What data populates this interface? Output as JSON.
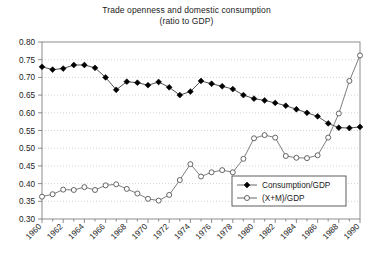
{
  "chart_data": {
    "type": "line",
    "title": "Trade openness and domestic consumption",
    "subtitle": "(ratio to GDP)",
    "xlabel": "",
    "ylabel": "",
    "ylim": [
      0.3,
      0.8
    ],
    "ytick_step": 0.05,
    "ytick_labels": [
      "0.80",
      "0.75",
      "0.70",
      "0.65",
      "0.60",
      "0.55",
      "0.50",
      "0.45",
      "0.40",
      "0.35",
      "0.30"
    ],
    "ytick_values": [
      0.8,
      0.75,
      0.7,
      0.65,
      0.6,
      0.55,
      0.5,
      0.45,
      0.4,
      0.35,
      0.3
    ],
    "xlim": [
      1960,
      1990
    ],
    "x": [
      1960,
      1961,
      1962,
      1963,
      1964,
      1965,
      1966,
      1967,
      1968,
      1969,
      1970,
      1971,
      1972,
      1973,
      1974,
      1975,
      1976,
      1977,
      1978,
      1979,
      1980,
      1981,
      1982,
      1983,
      1984,
      1985,
      1986,
      1987,
      1988,
      1989,
      1990
    ],
    "xtick_labels": [
      "1960",
      "1962",
      "1964",
      "1966",
      "1968",
      "1970",
      "1972",
      "1974",
      "1976",
      "1978",
      "1980",
      "1982",
      "1984",
      "1986",
      "1988",
      "1990"
    ],
    "xtick_values": [
      1960,
      1962,
      1964,
      1966,
      1968,
      1970,
      1972,
      1974,
      1976,
      1978,
      1980,
      1982,
      1984,
      1986,
      1988,
      1990
    ],
    "xtick_minor_every": 1,
    "grid": "horizontal-dotted",
    "legend_position": "inside-lower-right",
    "series": [
      {
        "name": "Consumption/GDP",
        "marker": "filled-diamond",
        "color": "#000000",
        "values": [
          0.73,
          0.722,
          0.725,
          0.735,
          0.735,
          0.727,
          0.7,
          0.665,
          0.688,
          0.685,
          0.678,
          0.687,
          0.672,
          0.65,
          0.66,
          0.69,
          0.682,
          0.675,
          0.667,
          0.65,
          0.64,
          0.635,
          0.628,
          0.62,
          0.61,
          0.6,
          0.59,
          0.57,
          0.558,
          0.557,
          0.56
        ]
      },
      {
        "name": "(X+M)/GDP",
        "marker": "open-circle",
        "color": "#000000",
        "values": [
          0.363,
          0.37,
          0.383,
          0.382,
          0.39,
          0.382,
          0.395,
          0.398,
          0.385,
          0.372,
          0.357,
          0.352,
          0.368,
          0.41,
          0.455,
          0.42,
          0.432,
          0.438,
          0.432,
          0.47,
          0.528,
          0.537,
          0.53,
          0.478,
          0.473,
          0.472,
          0.48,
          0.53,
          0.598,
          0.69,
          0.762
        ]
      }
    ]
  },
  "legend": {
    "entries": [
      {
        "label": "Consumption/GDP",
        "marker": "filled-diamond"
      },
      {
        "label": "(X+M)/GDP",
        "marker": "open-circle"
      }
    ]
  },
  "colors": {
    "axis": "#808080",
    "grid": "#c8c8c8",
    "series": "#000000",
    "text": "#1a1a1a",
    "background": "#ffffff"
  }
}
